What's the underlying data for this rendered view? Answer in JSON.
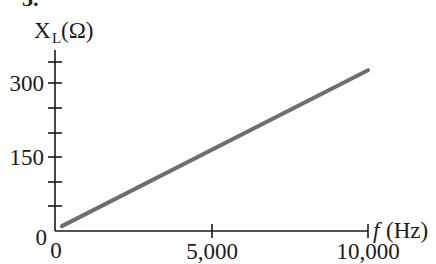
{
  "figure_label": "3.",
  "chart_data": {
    "type": "line",
    "title": "",
    "xlabel": "f (Hz)",
    "ylabel": "X_L (Ω)",
    "ylabel_parts": {
      "main": "X",
      "sub": "L",
      "unit": "(Ω)"
    },
    "xlabel_parts": {
      "var": "f",
      "unit": "(Hz)"
    },
    "x_ticks": [
      0,
      5000,
      10000
    ],
    "x_tick_labels": [
      "0",
      "5,000",
      "10,000"
    ],
    "y_ticks": [
      0,
      50,
      100,
      150,
      200,
      250,
      300,
      350
    ],
    "y_tick_labels": {
      "0": "0",
      "150": "150",
      "300": "300"
    },
    "xlim": [
      0,
      10000
    ],
    "ylim": [
      0,
      350
    ],
    "grid": false,
    "legend": null,
    "series": [
      {
        "name": "X_L",
        "color": "#6e6e6e",
        "x": [
          220,
          10000
        ],
        "y": [
          10,
          326
        ]
      }
    ]
  }
}
